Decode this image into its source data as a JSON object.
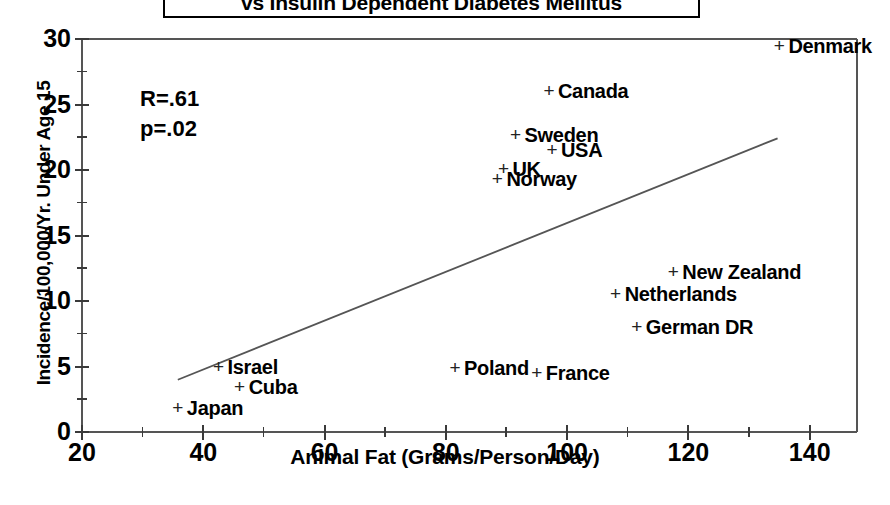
{
  "chart_data": {
    "type": "scatter",
    "title": "vs Insulin Dependent Diabetes Mellitus",
    "xlabel": "Animal Fat (Grams/Person/Day)",
    "ylabel": "Incidence/100,000/Yr. Under Age 15",
    "xlim": [
      20,
      147.8
    ],
    "ylim": [
      0,
      30
    ],
    "xticks": [
      20,
      40,
      60,
      80,
      100,
      120,
      140
    ],
    "xtick_labels": [
      "20",
      "40",
      "60",
      "80",
      "100",
      "120",
      "140"
    ],
    "xminor_step": 10,
    "yticks": [
      0,
      5,
      10,
      15,
      20,
      25,
      30
    ],
    "ytick_labels": [
      "0",
      "5",
      "10",
      "15",
      "20",
      "25",
      "30"
    ],
    "yminor_step": 2.5,
    "grid": false,
    "legend": null,
    "annotations": [
      {
        "name": "correlation",
        "text": "R=.61"
      },
      {
        "name": "p-value",
        "text": "p=.02"
      }
    ],
    "marker": "+",
    "trendline": {
      "x": [
        35.8,
        134.7
      ],
      "y": [
        3.99,
        22.42
      ]
    },
    "points": [
      {
        "label": "Denmark",
        "x": 135.0,
        "y": 29.5
      },
      {
        "label": "Canada",
        "x": 97.0,
        "y": 26.0
      },
      {
        "label": "Sweden",
        "x": 91.5,
        "y": 22.7
      },
      {
        "label": "USA",
        "x": 97.5,
        "y": 21.5
      },
      {
        "label": "UK",
        "x": 89.5,
        "y": 20.1
      },
      {
        "label": "Norway",
        "x": 88.5,
        "y": 19.3
      },
      {
        "label": "New Zealand",
        "x": 117.5,
        "y": 12.2
      },
      {
        "label": "Netherlands",
        "x": 108.0,
        "y": 10.5
      },
      {
        "label": "German DR",
        "x": 111.5,
        "y": 8.0
      },
      {
        "label": "Poland",
        "x": 81.5,
        "y": 4.9
      },
      {
        "label": "France",
        "x": 95.0,
        "y": 4.5
      },
      {
        "label": "Israel",
        "x": 42.5,
        "y": 5.0
      },
      {
        "label": "Cuba",
        "x": 46.0,
        "y": 3.4
      },
      {
        "label": "Japan",
        "x": 35.8,
        "y": 1.8
      }
    ]
  },
  "colors": {
    "axis": "#555555",
    "text": "#000000",
    "marker": "#222222",
    "trendline": "#555555",
    "background": "#ffffff"
  }
}
